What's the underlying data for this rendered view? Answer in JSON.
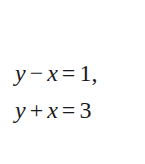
{
  "equations": [
    {
      "lhs_a": "y",
      "op1": "−",
      "lhs_b": "x",
      "eq": "=",
      "rhs": "1,"
    },
    {
      "lhs_a": "y",
      "op1": "+",
      "lhs_b": "x",
      "eq": "=",
      "rhs": "3"
    }
  ]
}
